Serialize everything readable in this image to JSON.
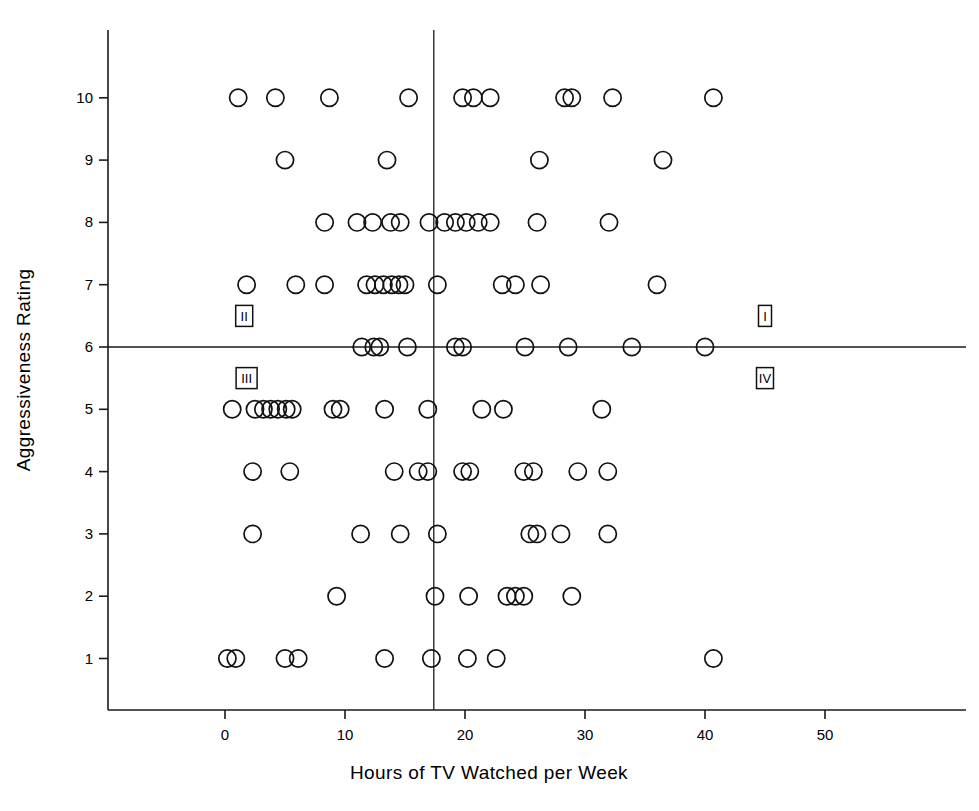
{
  "chart_data": {
    "type": "scatter",
    "title": "",
    "xlabel": "Hours of TV Watched per Week",
    "ylabel": "Aggressiveness Rating",
    "xlim": [
      -5,
      57
    ],
    "ylim": [
      0.2,
      11.4
    ],
    "xticks": [
      0,
      10,
      20,
      30,
      40,
      50
    ],
    "xticklabels": [
      "0",
      "10",
      "20",
      "30",
      "40",
      "50"
    ],
    "yticks": [
      1,
      2,
      3,
      4,
      5,
      6,
      7,
      8,
      9,
      10
    ],
    "yticklabels": [
      "1",
      "2",
      "3",
      "4",
      "5",
      "6",
      "7",
      "8",
      "9",
      "10"
    ],
    "grid": false,
    "legend": null,
    "marker": "open-circle",
    "reference_lines": [
      {
        "orientation": "vertical",
        "x": 17.4,
        "label": "mean hours of TV"
      },
      {
        "orientation": "horizontal",
        "y": 6.0,
        "label": "mean aggressiveness"
      }
    ],
    "annotations": [
      {
        "text": "II",
        "x": 1.6,
        "y": 6.5,
        "quadrant": "upper-left",
        "boxed": true
      },
      {
        "text": "I",
        "x": 45.0,
        "y": 6.5,
        "quadrant": "upper-right",
        "boxed": true
      },
      {
        "text": "III",
        "x": 1.8,
        "y": 5.5,
        "quadrant": "lower-left",
        "boxed": true
      },
      {
        "text": "IV",
        "x": 45.0,
        "y": 5.5,
        "quadrant": "lower-right",
        "boxed": true
      }
    ],
    "points": [
      {
        "x": 1.1,
        "y": 10
      },
      {
        "x": 4.2,
        "y": 10
      },
      {
        "x": 8.7,
        "y": 10
      },
      {
        "x": 15.3,
        "y": 10
      },
      {
        "x": 19.8,
        "y": 10
      },
      {
        "x": 20.7,
        "y": 10
      },
      {
        "x": 22.1,
        "y": 10
      },
      {
        "x": 28.3,
        "y": 10
      },
      {
        "x": 28.9,
        "y": 10
      },
      {
        "x": 32.3,
        "y": 10
      },
      {
        "x": 40.7,
        "y": 10
      },
      {
        "x": 5.0,
        "y": 9
      },
      {
        "x": 13.5,
        "y": 9
      },
      {
        "x": 26.2,
        "y": 9
      },
      {
        "x": 36.5,
        "y": 9
      },
      {
        "x": 8.3,
        "y": 8
      },
      {
        "x": 11.0,
        "y": 8
      },
      {
        "x": 12.3,
        "y": 8
      },
      {
        "x": 13.8,
        "y": 8
      },
      {
        "x": 14.6,
        "y": 8
      },
      {
        "x": 17.0,
        "y": 8
      },
      {
        "x": 18.3,
        "y": 8
      },
      {
        "x": 19.2,
        "y": 8
      },
      {
        "x": 20.1,
        "y": 8
      },
      {
        "x": 21.1,
        "y": 8
      },
      {
        "x": 22.1,
        "y": 8
      },
      {
        "x": 26.0,
        "y": 8
      },
      {
        "x": 32.0,
        "y": 8
      },
      {
        "x": 1.8,
        "y": 7
      },
      {
        "x": 5.9,
        "y": 7
      },
      {
        "x": 8.3,
        "y": 7
      },
      {
        "x": 11.8,
        "y": 7
      },
      {
        "x": 12.5,
        "y": 7
      },
      {
        "x": 13.2,
        "y": 7
      },
      {
        "x": 13.9,
        "y": 7
      },
      {
        "x": 14.5,
        "y": 7
      },
      {
        "x": 15.0,
        "y": 7
      },
      {
        "x": 17.7,
        "y": 7
      },
      {
        "x": 23.1,
        "y": 7
      },
      {
        "x": 24.2,
        "y": 7
      },
      {
        "x": 26.3,
        "y": 7
      },
      {
        "x": 36.0,
        "y": 7
      },
      {
        "x": 11.4,
        "y": 6
      },
      {
        "x": 12.4,
        "y": 6
      },
      {
        "x": 12.9,
        "y": 6
      },
      {
        "x": 15.2,
        "y": 6
      },
      {
        "x": 19.2,
        "y": 6
      },
      {
        "x": 19.8,
        "y": 6
      },
      {
        "x": 25.0,
        "y": 6
      },
      {
        "x": 28.6,
        "y": 6
      },
      {
        "x": 33.9,
        "y": 6
      },
      {
        "x": 40.0,
        "y": 6
      },
      {
        "x": 0.6,
        "y": 5
      },
      {
        "x": 2.5,
        "y": 5
      },
      {
        "x": 3.2,
        "y": 5
      },
      {
        "x": 3.8,
        "y": 5
      },
      {
        "x": 4.4,
        "y": 5
      },
      {
        "x": 5.1,
        "y": 5
      },
      {
        "x": 5.6,
        "y": 5
      },
      {
        "x": 9.0,
        "y": 5
      },
      {
        "x": 9.6,
        "y": 5
      },
      {
        "x": 13.3,
        "y": 5
      },
      {
        "x": 16.9,
        "y": 5
      },
      {
        "x": 21.4,
        "y": 5
      },
      {
        "x": 23.2,
        "y": 5
      },
      {
        "x": 31.4,
        "y": 5
      },
      {
        "x": 2.3,
        "y": 4
      },
      {
        "x": 5.4,
        "y": 4
      },
      {
        "x": 14.1,
        "y": 4
      },
      {
        "x": 16.1,
        "y": 4
      },
      {
        "x": 16.9,
        "y": 4
      },
      {
        "x": 19.8,
        "y": 4
      },
      {
        "x": 20.4,
        "y": 4
      },
      {
        "x": 24.9,
        "y": 4
      },
      {
        "x": 25.7,
        "y": 4
      },
      {
        "x": 29.4,
        "y": 4
      },
      {
        "x": 31.9,
        "y": 4
      },
      {
        "x": 2.3,
        "y": 3
      },
      {
        "x": 11.3,
        "y": 3
      },
      {
        "x": 14.6,
        "y": 3
      },
      {
        "x": 17.7,
        "y": 3
      },
      {
        "x": 25.4,
        "y": 3
      },
      {
        "x": 26.0,
        "y": 3
      },
      {
        "x": 28.0,
        "y": 3
      },
      {
        "x": 31.9,
        "y": 3
      },
      {
        "x": 9.3,
        "y": 2
      },
      {
        "x": 17.5,
        "y": 2
      },
      {
        "x": 20.3,
        "y": 2
      },
      {
        "x": 23.5,
        "y": 2
      },
      {
        "x": 24.2,
        "y": 2
      },
      {
        "x": 24.9,
        "y": 2
      },
      {
        "x": 28.9,
        "y": 2
      },
      {
        "x": 0.2,
        "y": 1
      },
      {
        "x": 0.9,
        "y": 1
      },
      {
        "x": 5.0,
        "y": 1
      },
      {
        "x": 6.1,
        "y": 1
      },
      {
        "x": 13.3,
        "y": 1
      },
      {
        "x": 17.2,
        "y": 1
      },
      {
        "x": 20.2,
        "y": 1
      },
      {
        "x": 22.6,
        "y": 1
      },
      {
        "x": 40.7,
        "y": 1
      }
    ]
  }
}
